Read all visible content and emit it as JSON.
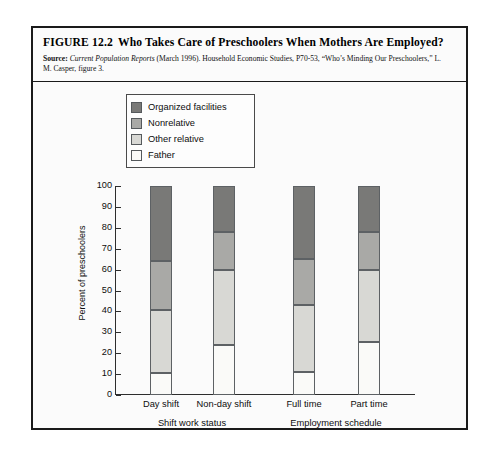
{
  "figure": {
    "number": "FIGURE 12.2",
    "title": "Who Takes Care of Preschoolers When Mothers Are Employed?",
    "source_label": "Source:",
    "source_italic": "Current Population Reports",
    "source_rest": " (March 1996). Household Economic Studies, P70-53, “Who’s Minding Our Preschoolers,” L. M. Casper, figure 3."
  },
  "chart_data": {
    "type": "bar",
    "subtype": "stacked-bar-100",
    "title": "Who Takes Care of Preschoolers When Mothers Are Employed?",
    "xlabel": "",
    "ylabel": "Percent of preschoolers",
    "ylim": [
      0,
      100
    ],
    "ytick_step": 10,
    "yticks": [
      0,
      10,
      20,
      30,
      40,
      50,
      60,
      70,
      80,
      90,
      100
    ],
    "grid": false,
    "legend_position": "upper-left-inset",
    "categories": [
      "Day shift",
      "Non-day shift",
      "Full time",
      "Part time"
    ],
    "group_labels": [
      "Shift work status",
      "Employment schedule"
    ],
    "group_spans": [
      [
        "Day shift",
        "Non-day shift"
      ],
      [
        "Full time",
        "Part time"
      ]
    ],
    "series": [
      {
        "name": "Father",
        "color": "#fafaf8",
        "values": [
          10.5,
          24.0,
          11.0,
          25.5
        ]
      },
      {
        "name": "Other relative",
        "color": "#d8d8d4",
        "values": [
          30.0,
          36.0,
          32.0,
          34.5
        ]
      },
      {
        "name": "Nonrelative",
        "color": "#a9a9a6",
        "values": [
          23.5,
          18.0,
          22.0,
          18.0
        ]
      },
      {
        "name": "Organized facilities",
        "color": "#797977",
        "values": [
          36.0,
          22.0,
          35.0,
          22.0
        ]
      }
    ],
    "cumulative_tops": {
      "Day shift": [
        10.5,
        40.5,
        64.0,
        100.0
      ],
      "Non-day shift": [
        24.0,
        60.0,
        78.0,
        100.0
      ],
      "Full time": [
        11.0,
        43.0,
        65.0,
        100.0
      ],
      "Part time": [
        25.5,
        60.0,
        78.0,
        100.0
      ]
    }
  },
  "legend": {
    "items": [
      {
        "label": "Organized facilities",
        "color": "#797977"
      },
      {
        "label": "Nonrelative",
        "color": "#a9a9a6"
      },
      {
        "label": "Other relative",
        "color": "#d8d8d4"
      },
      {
        "label": "Father",
        "color": "#fafaf8"
      }
    ]
  },
  "colors": {
    "frame": "#1a1a1a",
    "axis": "#2d2d2d",
    "page_background": "#ffffff",
    "figure_background": "#fbfbfb"
  }
}
